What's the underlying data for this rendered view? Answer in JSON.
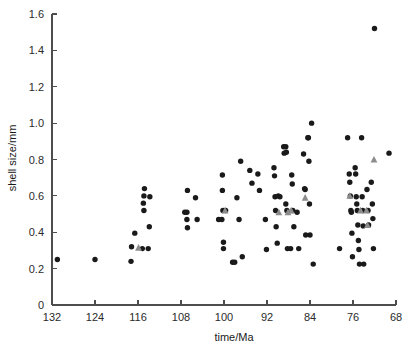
{
  "chart_data": {
    "type": "scatter",
    "title": "",
    "xlabel": "time/Ma",
    "ylabel": "shell size/mm",
    "xlim": [
      132,
      68
    ],
    "ylim": [
      0,
      1.6
    ],
    "x_axis_reversed": true,
    "xticks": [
      132,
      124,
      116,
      108,
      100,
      92,
      84,
      76,
      68
    ],
    "xtick_labels": [
      "132",
      "124",
      "116",
      "108",
      "100",
      "92",
      "84",
      "76",
      "68"
    ],
    "yticks": [
      0,
      0.2,
      0.4,
      0.6,
      0.8,
      1.0,
      1.2,
      1.4,
      1.6
    ],
    "ytick_labels": [
      "0",
      "0.2",
      "0.4",
      "0.6",
      "0.8",
      "1.0",
      "1.2",
      "1.4",
      "1.6"
    ],
    "grid": false,
    "legend": "none",
    "series": [
      {
        "name": "circle-markers",
        "marker": "circle",
        "color": "#1a1a1a",
        "points": [
          [
            131.0,
            0.25
          ],
          [
            124.0,
            0.25
          ],
          [
            117.3,
            0.24
          ],
          [
            117.2,
            0.32
          ],
          [
            116.6,
            0.395
          ],
          [
            115.2,
            0.31
          ],
          [
            114.8,
            0.64
          ],
          [
            114.9,
            0.6
          ],
          [
            115.0,
            0.56
          ],
          [
            114.9,
            0.52
          ],
          [
            114.1,
            0.31
          ],
          [
            113.8,
            0.595
          ],
          [
            113.9,
            0.43
          ],
          [
            107.3,
            0.51
          ],
          [
            106.9,
            0.51
          ],
          [
            106.9,
            0.47
          ],
          [
            106.8,
            0.425
          ],
          [
            106.8,
            0.63
          ],
          [
            105.3,
            0.59
          ],
          [
            105.0,
            0.47
          ],
          [
            101.0,
            0.47
          ],
          [
            100.4,
            0.47
          ],
          [
            100.3,
            0.63
          ],
          [
            100.3,
            0.715
          ],
          [
            100.2,
            0.52
          ],
          [
            100.1,
            0.345
          ],
          [
            100.1,
            0.31
          ],
          [
            99.7,
            0.52
          ],
          [
            98.4,
            0.235
          ],
          [
            98.0,
            0.235
          ],
          [
            97.6,
            0.59
          ],
          [
            97.2,
            0.47
          ],
          [
            96.9,
            0.79
          ],
          [
            96.6,
            0.265
          ],
          [
            95.2,
            0.74
          ],
          [
            94.8,
            0.67
          ],
          [
            93.7,
            0.72
          ],
          [
            93.4,
            0.63
          ],
          [
            92.3,
            0.47
          ],
          [
            92.1,
            0.305
          ],
          [
            90.7,
            0.755
          ],
          [
            90.6,
            0.71
          ],
          [
            90.5,
            0.595
          ],
          [
            90.4,
            0.52
          ],
          [
            90.3,
            0.43
          ],
          [
            90.1,
            0.34
          ],
          [
            89.9,
            0.6
          ],
          [
            89.6,
            0.595
          ],
          [
            88.9,
            0.87
          ],
          [
            88.5,
            0.87
          ],
          [
            88.8,
            0.835
          ],
          [
            88.4,
            0.84
          ],
          [
            88.5,
            0.555
          ],
          [
            88.3,
            0.52
          ],
          [
            88.2,
            0.31
          ],
          [
            87.6,
            0.31
          ],
          [
            87.4,
            0.715
          ],
          [
            87.3,
            0.665
          ],
          [
            87.2,
            0.52
          ],
          [
            87.0,
            0.43
          ],
          [
            86.4,
            0.51
          ],
          [
            86.1,
            0.31
          ],
          [
            85.2,
            0.83
          ],
          [
            85.0,
            0.64
          ],
          [
            84.9,
            0.635
          ],
          [
            84.8,
            0.385
          ],
          [
            84.4,
            0.92
          ],
          [
            84.3,
            0.92
          ],
          [
            84.2,
            0.79
          ],
          [
            84.1,
            0.555
          ],
          [
            84.0,
            0.385
          ],
          [
            83.7,
            1.0
          ],
          [
            83.4,
            0.225
          ],
          [
            78.5,
            0.31
          ],
          [
            77.0,
            0.92
          ],
          [
            76.7,
            0.72
          ],
          [
            76.6,
            0.675
          ],
          [
            76.5,
            0.6
          ],
          [
            76.4,
            0.52
          ],
          [
            76.3,
            0.51
          ],
          [
            76.2,
            0.395
          ],
          [
            76.1,
            0.265
          ],
          [
            75.6,
            0.755
          ],
          [
            75.5,
            0.72
          ],
          [
            75.4,
            0.595
          ],
          [
            75.3,
            0.555
          ],
          [
            75.2,
            0.52
          ],
          [
            75.1,
            0.44
          ],
          [
            75.0,
            0.355
          ],
          [
            74.9,
            0.305
          ],
          [
            74.8,
            0.225
          ],
          [
            74.4,
            0.92
          ],
          [
            74.3,
            0.595
          ],
          [
            74.2,
            0.52
          ],
          [
            74.1,
            0.435
          ],
          [
            74.0,
            0.225
          ],
          [
            73.4,
            0.635
          ],
          [
            73.2,
            0.52
          ],
          [
            73.1,
            0.44
          ],
          [
            72.6,
            0.675
          ],
          [
            72.4,
            0.555
          ],
          [
            72.3,
            0.475
          ],
          [
            72.2,
            0.31
          ],
          [
            72.0,
            1.52
          ],
          [
            69.3,
            0.835
          ]
        ]
      },
      {
        "name": "triangle-markers",
        "marker": "triangle",
        "color": "#8c8c8c",
        "points": [
          [
            115.9,
            0.315
          ],
          [
            99.8,
            0.52
          ],
          [
            89.8,
            0.51
          ],
          [
            88.1,
            0.51
          ],
          [
            87.5,
            0.52
          ],
          [
            84.9,
            0.59
          ],
          [
            76.6,
            0.6
          ],
          [
            74.6,
            0.52
          ],
          [
            73.5,
            0.52
          ],
          [
            73.3,
            0.44
          ],
          [
            72.1,
            0.8
          ]
        ]
      }
    ]
  },
  "axes": {
    "xlabel": "time/Ma",
    "ylabel": "shell size/mm"
  }
}
